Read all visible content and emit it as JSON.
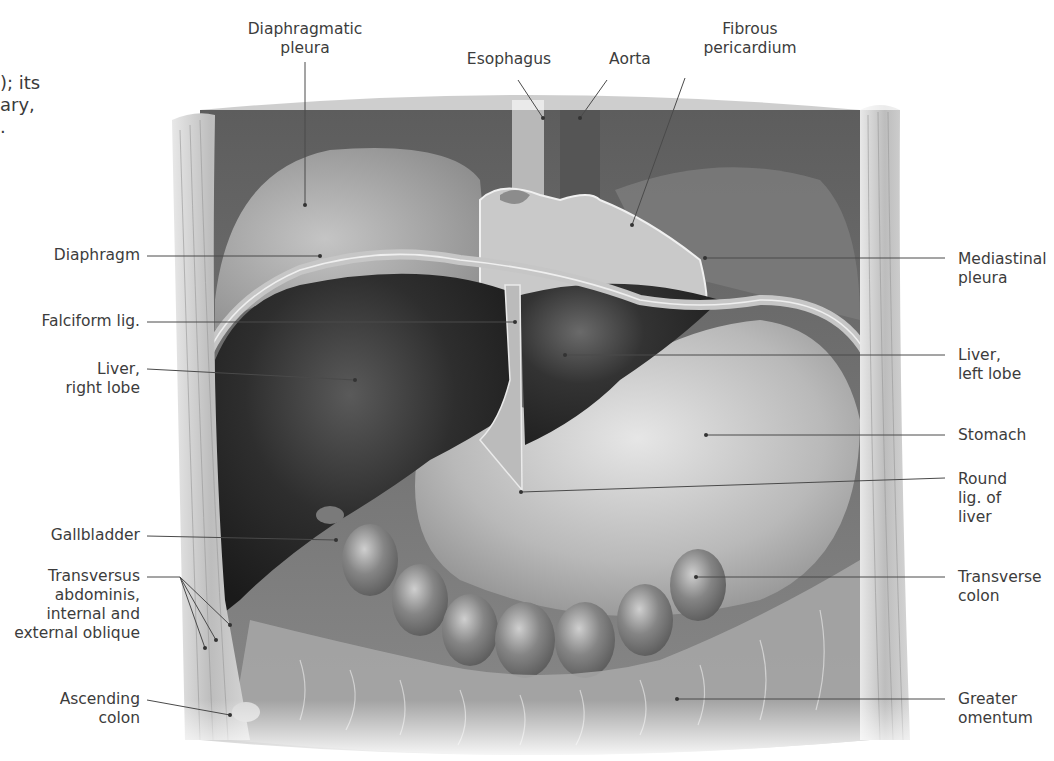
{
  "figure": {
    "left_text_fragment": [
      "); its",
      "ary,",
      "."
    ],
    "labels": {
      "diaphragmatic_pleura": [
        "Diaphragmatic",
        "pleura"
      ],
      "esophagus": [
        "Esophagus"
      ],
      "aorta": [
        "Aorta"
      ],
      "fibrous_pericardium": [
        "Fibrous",
        "pericardium"
      ],
      "diaphragm": [
        "Diaphragm"
      ],
      "falciform_lig": [
        "Falciform lig."
      ],
      "liver_right_lobe": [
        "Liver,",
        "right lobe"
      ],
      "gallbladder": [
        "Gallbladder"
      ],
      "transversus": [
        "Transversus",
        "abdominis,",
        "internal and",
        "external oblique"
      ],
      "ascending_colon": [
        "Ascending",
        "colon"
      ],
      "mediastinal_pleura": [
        "Mediastinal",
        "pleura"
      ],
      "liver_left_lobe": [
        "Liver,",
        "left lobe"
      ],
      "stomach": [
        "Stomach"
      ],
      "round_lig": [
        "Round",
        "lig. of",
        "liver"
      ],
      "transverse_colon": [
        "Transverse",
        "colon"
      ],
      "greater_omentum": [
        "Greater",
        "omentum"
      ]
    },
    "colors": {
      "label_text": "#3c3c3c",
      "leader_line": "#4a4a4a",
      "liver": "#2a2a2a",
      "stomach": "#bdbdbd",
      "body_wall": "#c8c8c8",
      "background": "#ffffff"
    }
  }
}
